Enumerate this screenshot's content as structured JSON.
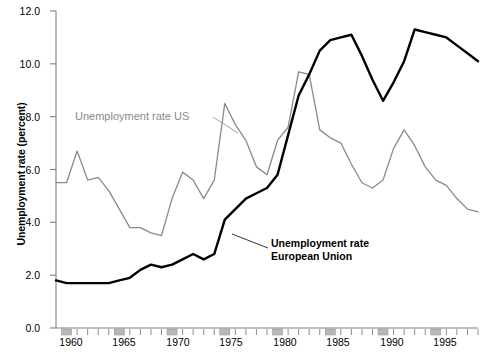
{
  "chart_data": {
    "type": "line",
    "title": "",
    "xlabel": "",
    "ylabel": "Unemployment rate (percent)",
    "ylim": [
      0.0,
      12.0
    ],
    "xlim": [
      1959,
      1999
    ],
    "grid": false,
    "legend_position": "inline-annotations",
    "ytick_labels": [
      "0.0",
      "2.0",
      "4.0",
      "6.0",
      "8.0",
      "10.0",
      "12.0"
    ],
    "ytick_values": [
      0.0,
      2.0,
      4.0,
      6.0,
      8.0,
      10.0,
      12.0
    ],
    "xtick_labels": [
      "1960",
      "1965",
      "1970",
      "1975",
      "1980",
      "1985",
      "1990",
      "1995"
    ],
    "xtick_values": [
      1960,
      1965,
      1970,
      1975,
      1980,
      1985,
      1990,
      1995
    ],
    "x": [
      1959,
      1960,
      1961,
      1962,
      1963,
      1964,
      1965,
      1966,
      1967,
      1968,
      1969,
      1970,
      1971,
      1972,
      1973,
      1974,
      1975,
      1976,
      1977,
      1978,
      1979,
      1980,
      1981,
      1982,
      1983,
      1984,
      1985,
      1986,
      1987,
      1988,
      1989,
      1990,
      1991,
      1992,
      1993,
      1994,
      1995,
      1996,
      1997,
      1998,
      1999
    ],
    "series": [
      {
        "name": "Unemployment rate US",
        "color": "#8a8a8a",
        "linewidth": 1.3,
        "values": [
          5.5,
          5.5,
          6.7,
          5.6,
          5.7,
          5.2,
          4.5,
          3.8,
          3.8,
          3.6,
          3.5,
          4.9,
          5.9,
          5.6,
          4.9,
          5.6,
          8.5,
          7.7,
          7.1,
          6.1,
          5.8,
          7.1,
          7.6,
          9.7,
          9.6,
          7.5,
          7.2,
          7.0,
          6.2,
          5.5,
          5.3,
          5.6,
          6.8,
          7.5,
          6.9,
          6.1,
          5.6,
          5.4,
          4.9,
          4.5,
          4.4
        ]
      },
      {
        "name": "Unemployment rate European Union",
        "color": "#000000",
        "linewidth": 2.4,
        "values": [
          1.8,
          1.7,
          1.7,
          1.7,
          1.7,
          1.7,
          1.8,
          1.9,
          2.2,
          2.4,
          2.3,
          2.4,
          2.6,
          2.8,
          2.6,
          2.8,
          4.1,
          4.5,
          4.9,
          5.1,
          5.3,
          5.8,
          7.3,
          8.8,
          9.6,
          10.5,
          10.9,
          11.0,
          11.1,
          10.3,
          9.4,
          8.6,
          9.3,
          10.1,
          11.3,
          11.2,
          11.1,
          11.0,
          10.7,
          10.4,
          10.1
        ]
      }
    ],
    "annotations": [
      {
        "text": "Unemployment rate US",
        "series": "Unemployment rate US",
        "style": "gray-plain"
      },
      {
        "text_line1": "Unemployment rate",
        "text_line2": "European Union",
        "series": "Unemployment rate European Union",
        "style": "black-bold"
      }
    ]
  },
  "axis": {
    "y_label": "Unemployment rate (percent)",
    "y_ticks": [
      "12.0",
      "10.0",
      "8.0",
      "6.0",
      "4.0",
      "2.0",
      "0.0"
    ],
    "x_ticks": [
      "1960",
      "1965",
      "1970",
      "1975",
      "1980",
      "1985",
      "1990",
      "1995"
    ]
  },
  "annotations": {
    "us_label": "Unemployment rate US",
    "eu_label_line1": "Unemployment rate",
    "eu_label_line2": "European Union"
  },
  "colors": {
    "us_line": "#8a8a8a",
    "eu_line": "#000000",
    "axis": "#808080",
    "tick_bar": "#b8b8b8",
    "text": "#000000"
  }
}
